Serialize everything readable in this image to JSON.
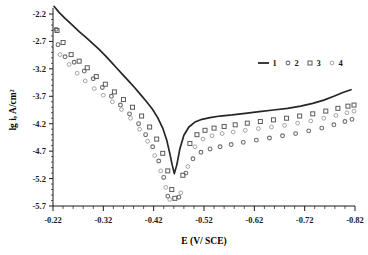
{
  "chart_data": {
    "type": "scatter",
    "title": "",
    "xlabel": "E (V/ SCE)",
    "ylabel": "lg i, A/cm²",
    "xlim": [
      -0.22,
      -0.82
    ],
    "ylim": [
      -5.7,
      -2.2
    ],
    "x_ticks": [
      -0.22,
      -0.32,
      -0.42,
      -0.52,
      -0.62,
      -0.72,
      -0.82
    ],
    "x_tick_labels": [
      "-0.22",
      "-0.32",
      "-0.42",
      "-0.52",
      "-0.62",
      "-0.72",
      "-0.82"
    ],
    "y_ticks": [
      -2.2,
      -2.7,
      -3.2,
      -3.7,
      -4.2,
      -4.7,
      -5.2,
      -5.7
    ],
    "y_tick_labels": [
      "-2.2",
      "-2.7",
      "-3.2",
      "-3.7",
      "-4.2",
      "-4.7",
      "-5.2",
      "-5.7"
    ],
    "x_minor_tick_count": 5,
    "y_minor_tick_count": 5,
    "grid": false,
    "legend_position": "top-right",
    "axis_color": "#1a1a1a",
    "series": [
      {
        "name": "1",
        "marker": "line",
        "color": "#262626",
        "points": [
          [
            -0.222,
            -2.06
          ],
          [
            -0.232,
            -2.17
          ],
          [
            -0.244,
            -2.28
          ],
          [
            -0.258,
            -2.4
          ],
          [
            -0.272,
            -2.52
          ],
          [
            -0.286,
            -2.63
          ],
          [
            -0.298,
            -2.73
          ],
          [
            -0.31,
            -2.83
          ],
          [
            -0.322,
            -2.94
          ],
          [
            -0.334,
            -3.06
          ],
          [
            -0.346,
            -3.18
          ],
          [
            -0.358,
            -3.3
          ],
          [
            -0.37,
            -3.42
          ],
          [
            -0.382,
            -3.54
          ],
          [
            -0.394,
            -3.67
          ],
          [
            -0.406,
            -3.8
          ],
          [
            -0.418,
            -3.94
          ],
          [
            -0.428,
            -4.09
          ],
          [
            -0.438,
            -4.28
          ],
          [
            -0.446,
            -4.5
          ],
          [
            -0.452,
            -4.74
          ],
          [
            -0.457,
            -4.96
          ],
          [
            -0.461,
            -5.11
          ],
          [
            -0.466,
            -4.95
          ],
          [
            -0.472,
            -4.66
          ],
          [
            -0.48,
            -4.41
          ],
          [
            -0.49,
            -4.26
          ],
          [
            -0.502,
            -4.17
          ],
          [
            -0.516,
            -4.12
          ],
          [
            -0.532,
            -4.09
          ],
          [
            -0.552,
            -4.06
          ],
          [
            -0.576,
            -4.04
          ],
          [
            -0.602,
            -4.01
          ],
          [
            -0.63,
            -3.98
          ],
          [
            -0.658,
            -3.95
          ],
          [
            -0.686,
            -3.92
          ],
          [
            -0.712,
            -3.88
          ],
          [
            -0.736,
            -3.83
          ],
          [
            -0.758,
            -3.77
          ],
          [
            -0.778,
            -3.7
          ],
          [
            -0.796,
            -3.63
          ],
          [
            -0.812,
            -3.58
          ]
        ]
      },
      {
        "name": "2",
        "marker": "circle",
        "color": "#6e6e6e",
        "points": [
          [
            -0.226,
            -2.48
          ],
          [
            -0.23,
            -2.76
          ],
          [
            -0.244,
            -2.98
          ],
          [
            -0.262,
            -3.08
          ],
          [
            -0.282,
            -3.24
          ],
          [
            -0.3,
            -3.38
          ],
          [
            -0.318,
            -3.54
          ],
          [
            -0.336,
            -3.7
          ],
          [
            -0.354,
            -3.86
          ],
          [
            -0.372,
            -4.02
          ],
          [
            -0.39,
            -4.2
          ],
          [
            -0.404,
            -4.4
          ],
          [
            -0.418,
            -4.62
          ],
          [
            -0.43,
            -4.88
          ],
          [
            -0.44,
            -5.18
          ],
          [
            -0.448,
            -5.52
          ],
          [
            -0.47,
            -5.54
          ],
          [
            -0.484,
            -5.1
          ],
          [
            -0.498,
            -4.84
          ],
          [
            -0.514,
            -4.72
          ],
          [
            -0.532,
            -4.66
          ],
          [
            -0.552,
            -4.62
          ],
          [
            -0.574,
            -4.58
          ],
          [
            -0.598,
            -4.54
          ],
          [
            -0.624,
            -4.5
          ],
          [
            -0.65,
            -4.46
          ],
          [
            -0.676,
            -4.42
          ],
          [
            -0.702,
            -4.38
          ],
          [
            -0.728,
            -4.33
          ],
          [
            -0.754,
            -4.28
          ],
          [
            -0.778,
            -4.22
          ],
          [
            -0.8,
            -4.16
          ],
          [
            -0.814,
            -4.12
          ]
        ]
      },
      {
        "name": "3",
        "marker": "square",
        "color": "#5a5a5a",
        "points": [
          [
            -0.228,
            -2.5
          ],
          [
            -0.24,
            -2.72
          ],
          [
            -0.256,
            -2.94
          ],
          [
            -0.272,
            -3.06
          ],
          [
            -0.288,
            -3.18
          ],
          [
            -0.306,
            -3.34
          ],
          [
            -0.324,
            -3.48
          ],
          [
            -0.342,
            -3.62
          ],
          [
            -0.36,
            -3.76
          ],
          [
            -0.378,
            -3.9
          ],
          [
            -0.396,
            -4.06
          ],
          [
            -0.412,
            -4.26
          ],
          [
            -0.426,
            -4.48
          ],
          [
            -0.438,
            -4.74
          ],
          [
            -0.448,
            -5.06
          ],
          [
            -0.456,
            -5.4
          ],
          [
            -0.462,
            -5.56
          ],
          [
            -0.478,
            -5.14
          ],
          [
            -0.492,
            -4.56
          ],
          [
            -0.506,
            -4.4
          ],
          [
            -0.522,
            -4.32
          ],
          [
            -0.54,
            -4.28
          ],
          [
            -0.56,
            -4.25
          ],
          [
            -0.582,
            -4.22
          ],
          [
            -0.606,
            -4.19
          ],
          [
            -0.632,
            -4.16
          ],
          [
            -0.658,
            -4.13
          ],
          [
            -0.684,
            -4.1
          ],
          [
            -0.71,
            -4.06
          ],
          [
            -0.736,
            -4.02
          ],
          [
            -0.762,
            -3.97
          ],
          [
            -0.786,
            -3.92
          ],
          [
            -0.806,
            -3.88
          ],
          [
            -0.818,
            -3.86
          ]
        ]
      },
      {
        "name": "4",
        "marker": "circle-open",
        "color": "#9a9a9a",
        "points": [
          [
            -0.234,
            -2.94
          ],
          [
            -0.252,
            -3.12
          ],
          [
            -0.268,
            -3.28
          ],
          [
            -0.284,
            -3.42
          ],
          [
            -0.302,
            -3.56
          ],
          [
            -0.32,
            -3.68
          ],
          [
            -0.338,
            -3.8
          ],
          [
            -0.356,
            -3.94
          ],
          [
            -0.374,
            -4.1
          ],
          [
            -0.392,
            -4.3
          ],
          [
            -0.408,
            -4.52
          ],
          [
            -0.422,
            -4.78
          ],
          [
            -0.434,
            -5.06
          ],
          [
            -0.444,
            -5.36
          ],
          [
            -0.452,
            -5.58
          ],
          [
            -0.474,
            -5.46
          ],
          [
            -0.488,
            -4.98
          ],
          [
            -0.502,
            -4.62
          ],
          [
            -0.518,
            -4.48
          ],
          [
            -0.536,
            -4.42
          ],
          [
            -0.556,
            -4.38
          ],
          [
            -0.578,
            -4.35
          ],
          [
            -0.602,
            -4.32
          ],
          [
            -0.628,
            -4.29
          ],
          [
            -0.654,
            -4.26
          ],
          [
            -0.68,
            -4.23
          ],
          [
            -0.706,
            -4.19
          ],
          [
            -0.732,
            -4.15
          ],
          [
            -0.758,
            -4.1
          ],
          [
            -0.782,
            -4.05
          ],
          [
            -0.804,
            -4.0
          ],
          [
            -0.818,
            -3.97
          ]
        ]
      }
    ],
    "legend_entries": [
      {
        "label": "1",
        "marker": "line"
      },
      {
        "label": "2",
        "marker": "circle"
      },
      {
        "label": "3",
        "marker": "square"
      },
      {
        "label": "4",
        "marker": "circle-open"
      }
    ]
  }
}
